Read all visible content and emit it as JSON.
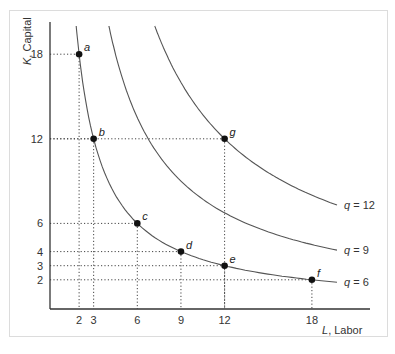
{
  "chart_data": {
    "type": "line",
    "title": "",
    "xlabel_var": "L",
    "xlabel_text": ", Labor",
    "ylabel_var": "K",
    "ylabel_text": ", Capital",
    "x_ticks": [
      2,
      3,
      6,
      9,
      12,
      18
    ],
    "y_ticks": [
      2,
      3,
      4,
      6,
      12,
      18
    ],
    "xlim": [
      0,
      21
    ],
    "ylim": [
      0,
      20
    ],
    "grid": false,
    "series": [
      {
        "name": "q = 6",
        "label_var": "q",
        "label_value": "= 6",
        "product": 36
      },
      {
        "name": "q = 9",
        "label_var": "q",
        "label_value": "= 9",
        "product": 81
      },
      {
        "name": "q = 12",
        "label_var": "q",
        "label_value": "= 12",
        "product": 144
      }
    ],
    "points": [
      {
        "label": "a",
        "L": 2,
        "K": 18,
        "isoquant": "q = 6"
      },
      {
        "label": "b",
        "L": 3,
        "K": 12,
        "isoquant": "q = 6"
      },
      {
        "label": "c",
        "L": 6,
        "K": 6,
        "isoquant": "q = 6"
      },
      {
        "label": "d",
        "L": 9,
        "K": 4,
        "isoquant": "q = 6"
      },
      {
        "label": "e",
        "L": 12,
        "K": 3,
        "isoquant": "q = 6"
      },
      {
        "label": "f",
        "L": 18,
        "K": 2,
        "isoquant": "q = 6"
      },
      {
        "label": "g",
        "L": 12,
        "K": 12,
        "isoquant": "q = 12"
      }
    ]
  }
}
